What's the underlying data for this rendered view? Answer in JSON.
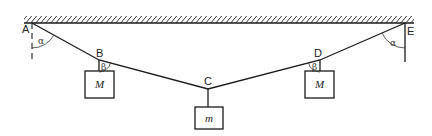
{
  "diagram": {
    "points": {
      "A": {
        "label": "A",
        "x": 32,
        "y": 23
      },
      "B": {
        "label": "B",
        "x": 99,
        "y": 60
      },
      "C": {
        "label": "C",
        "x": 208,
        "y": 89
      },
      "D": {
        "label": "D",
        "x": 320,
        "y": 60
      },
      "E": {
        "label": "E",
        "x": 405,
        "y": 23
      }
    },
    "masses": [
      {
        "id": "mass-left",
        "label": "M",
        "hangs_from": "B"
      },
      {
        "id": "mass-center",
        "label": "m",
        "hangs_from": "C"
      },
      {
        "id": "mass-right",
        "label": "M",
        "hangs_from": "D"
      }
    ],
    "angles": [
      {
        "id": "alpha-left",
        "label": "α",
        "at": "A"
      },
      {
        "id": "beta-left",
        "label": "β",
        "at": "B"
      },
      {
        "id": "beta-right",
        "label": "β",
        "at": "D"
      },
      {
        "id": "alpha-right",
        "label": "α",
        "at": "E"
      }
    ],
    "colors": {
      "ink": "#1a1a1a",
      "background": "#ffffff"
    }
  }
}
